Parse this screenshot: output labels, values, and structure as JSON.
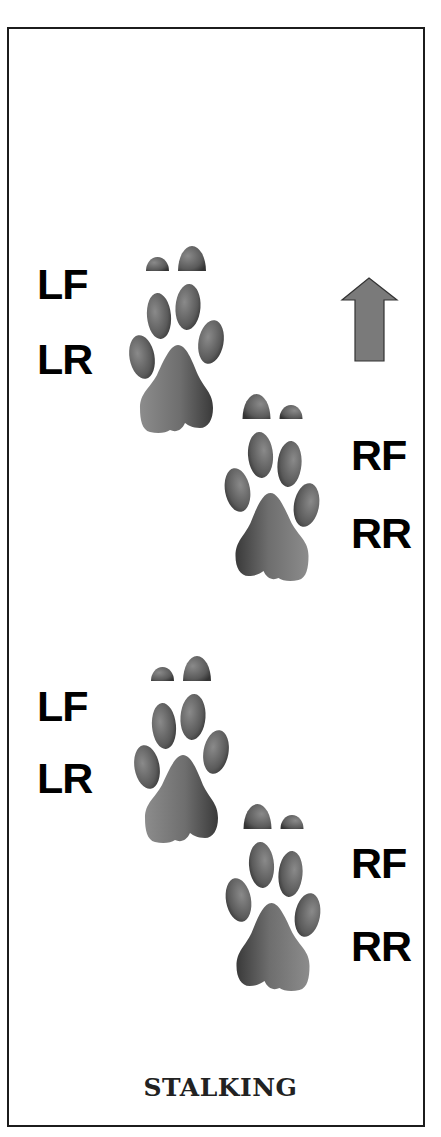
{
  "diagram": {
    "caption": "STALKING",
    "direction_icon": "up-arrow-icon",
    "colors": {
      "border": "#1c1c1c",
      "arrow_fill": "#7a7a7a",
      "arrow_stroke": "#333333",
      "paw_light": "#8c8c8c",
      "paw_dark": "#3a3a3a"
    },
    "track_groups": [
      {
        "left_labels": [
          "LF",
          "LR"
        ],
        "right_labels": [
          "RF",
          "RR"
        ]
      },
      {
        "left_labels": [
          "LF",
          "LR"
        ],
        "right_labels": [
          "RF",
          "RR"
        ]
      }
    ]
  }
}
